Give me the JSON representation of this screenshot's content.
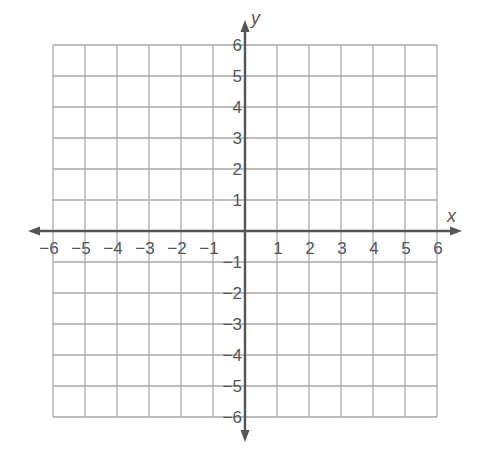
{
  "chart_data": {
    "type": "scatter",
    "title": "",
    "xlabel": "x",
    "ylabel": "y",
    "xlim": [
      -6,
      6
    ],
    "ylim": [
      -6,
      6
    ],
    "grid": true,
    "x_ticks": [
      -6,
      -5,
      -4,
      -3,
      -2,
      -1,
      1,
      2,
      3,
      4,
      5,
      6
    ],
    "y_ticks": [
      -6,
      -5,
      -4,
      -3,
      -2,
      -1,
      1,
      2,
      3,
      4,
      5,
      6
    ],
    "x_tick_labels": [
      "−6",
      "−5",
      "−4",
      "−3",
      "−2",
      "−1",
      "1",
      "2",
      "3",
      "4",
      "5",
      "6"
    ],
    "y_tick_labels": [
      "−6",
      "−5",
      "−4",
      "−3",
      "−2",
      "−1",
      "1",
      "2",
      "3",
      "4",
      "5",
      "6"
    ],
    "series": [],
    "legend": null
  },
  "axes": {
    "x_label": "x",
    "y_label": "y"
  },
  "colors": {
    "grid": "#a9a9a9",
    "axis": "#555555",
    "text": "#555555",
    "background": "#ffffff"
  }
}
